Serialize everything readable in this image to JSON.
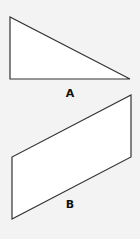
{
  "diagram": {
    "background": "#f3f3f3",
    "stroke_color": "#333333",
    "fill_color": "#ffffff",
    "shapes": [
      {
        "id": "A",
        "type": "right-triangle",
        "label": "A",
        "points": [
          [
            10,
            17
          ],
          [
            10,
            79
          ],
          [
            130,
            79
          ]
        ],
        "label_position": [
          70,
          88
        ]
      },
      {
        "id": "B",
        "type": "parallelogram",
        "label": "B",
        "points": [
          [
            131,
            95
          ],
          [
            131,
            157
          ],
          [
            12,
            219
          ],
          [
            12,
            157
          ]
        ],
        "label_position": [
          70,
          199
        ]
      }
    ]
  }
}
